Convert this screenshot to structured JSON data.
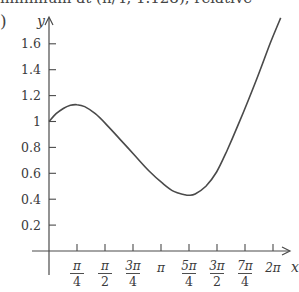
{
  "header": {
    "top_text": "minimum at (π/4, 1.128), relative",
    "part_label": ")"
  },
  "chart_data": {
    "type": "line",
    "title": "",
    "xlabel": "x",
    "ylabel": "y",
    "xlim": [
      0,
      6.5
    ],
    "ylim": [
      0,
      1.8
    ],
    "grid": false,
    "legend": null,
    "x_ticks": [
      {
        "value": 0.7854,
        "num": "π",
        "den": "4"
      },
      {
        "value": 1.5708,
        "num": "π",
        "den": "2"
      },
      {
        "value": 2.3562,
        "num": "3π",
        "den": "4"
      },
      {
        "value": 3.1416,
        "num": "π",
        "den": ""
      },
      {
        "value": 3.927,
        "num": "5π",
        "den": "4"
      },
      {
        "value": 4.7124,
        "num": "3π",
        "den": "2"
      },
      {
        "value": 5.4978,
        "num": "7π",
        "den": "4"
      },
      {
        "value": 6.2832,
        "num": "2π",
        "den": ""
      }
    ],
    "y_ticks": [
      0.2,
      0.4,
      0.6,
      0.8,
      1,
      1.2,
      1.4,
      1.6
    ],
    "y_tick_labels": [
      "0.2",
      "0.4",
      "0.6",
      "0.8",
      "1",
      "1.2",
      "1.4",
      "1.6"
    ],
    "series": [
      {
        "name": "f(x)",
        "x": [
          0,
          0.2,
          0.4,
          0.6,
          0.785,
          1.0,
          1.3,
          1.6,
          2.0,
          2.4,
          2.8,
          3.2,
          3.5,
          3.8,
          3.93,
          4.1,
          4.4,
          4.7,
          5.0,
          5.3,
          5.6,
          5.9,
          6.2,
          6.5
        ],
        "y": [
          1.0,
          1.06,
          1.1,
          1.125,
          1.13,
          1.115,
          1.06,
          0.98,
          0.86,
          0.74,
          0.62,
          0.52,
          0.46,
          0.435,
          0.43,
          0.44,
          0.5,
          0.61,
          0.78,
          0.97,
          1.17,
          1.38,
          1.6,
          1.8
        ]
      }
    ],
    "annotations": []
  }
}
